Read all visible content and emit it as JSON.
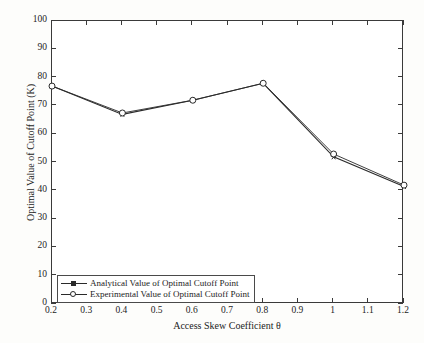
{
  "chart_data": {
    "type": "line",
    "title": "",
    "xlabel": "Access Skew Coefficient θ",
    "ylabel": "Optimal Value of Cutoff Point (K)",
    "xlim": [
      0.2,
      1.2
    ],
    "ylim": [
      0,
      100
    ],
    "xticks": [
      "0.2",
      "0.3",
      "0.4",
      "0.5",
      "0.6",
      "0.7",
      "0.8",
      "0.9",
      "1",
      "1.1",
      "1.2"
    ],
    "xtick_values": [
      0.2,
      0.3,
      0.4,
      0.5,
      0.6,
      0.7,
      0.8,
      0.9,
      1.0,
      1.1,
      1.2
    ],
    "yticks": [
      "0",
      "10",
      "20",
      "30",
      "40",
      "50",
      "60",
      "70",
      "80",
      "90",
      "100"
    ],
    "ytick_values": [
      0,
      10,
      20,
      30,
      40,
      50,
      60,
      70,
      80,
      90,
      100
    ],
    "grid": false,
    "legend_position": "lower-left",
    "x": [
      0.2,
      0.4,
      0.6,
      0.8,
      1.0,
      1.2
    ],
    "series": [
      {
        "name": "Analytical Value of Optimal Cutoff Point",
        "marker": "star",
        "color": "#2a2a2a",
        "values": [
          77,
          67,
          72,
          78,
          52,
          41.5
        ]
      },
      {
        "name": "Experimental Value of Optimal Cutoff Point",
        "marker": "circle",
        "color": "#2a2a2a",
        "values": [
          77,
          67.5,
          72,
          78,
          53,
          42
        ]
      }
    ]
  },
  "legend": {
    "items": [
      {
        "label": "Analytical Value of Optimal Cutoff Point"
      },
      {
        "label": "Experimental Value of Optimal Cutoff Point"
      }
    ]
  }
}
